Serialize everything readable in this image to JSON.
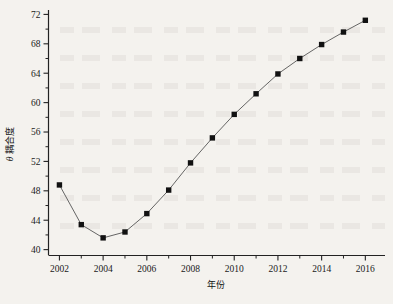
{
  "chart_data": {
    "type": "line",
    "title": "",
    "subtitle": "",
    "xlabel": "年份",
    "ylabel": "耦合度 θ",
    "ylabel_text": "耦合度",
    "ylabel_symbol": "θ",
    "x": [
      2002,
      2003,
      2004,
      2005,
      2006,
      2007,
      2008,
      2009,
      2010,
      2011,
      2012,
      2013,
      2014,
      2015,
      2016
    ],
    "values": [
      48.8,
      43.4,
      41.6,
      42.4,
      44.9,
      48.1,
      51.8,
      55.2,
      58.4,
      61.2,
      63.9,
      66.0,
      67.9,
      69.6,
      71.2
    ],
    "series": [
      {
        "name": "耦合度 θ",
        "values": [
          48.8,
          43.4,
          41.6,
          42.4,
          44.9,
          48.1,
          51.8,
          55.2,
          58.4,
          61.2,
          63.9,
          66.0,
          67.9,
          69.6,
          71.2
        ]
      }
    ],
    "xlim": [
      2001.5,
      2016.9
    ],
    "ylim": [
      39.2,
      72.6
    ],
    "xticks": [
      2002,
      2004,
      2006,
      2008,
      2010,
      2012,
      2014,
      2016
    ],
    "xtick_labels": [
      "2002",
      "2004",
      "2006",
      "2008",
      "2010",
      "2012",
      "2014",
      "2016"
    ],
    "xminor_ticks": [
      2003,
      2005,
      2007,
      2009,
      2011,
      2013,
      2015
    ],
    "yticks": [
      40,
      44,
      48,
      52,
      56,
      60,
      64,
      68,
      72
    ],
    "ytick_labels": [
      "40",
      "44",
      "48",
      "52",
      "56",
      "60",
      "64",
      "68",
      "72"
    ],
    "yminor_ticks": [
      42,
      46,
      50,
      54,
      58,
      62,
      66,
      70
    ],
    "grid": false,
    "legend": false,
    "legend_position": "none",
    "marker": "square",
    "marker_color": "#111111",
    "line_color": "#555555",
    "axis_color": "#222222",
    "background_color": "#f4f2ee",
    "annotations": []
  }
}
